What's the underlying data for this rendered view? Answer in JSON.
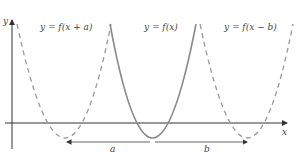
{
  "labels": {
    "y_axis": "y",
    "x_axis": "x",
    "left_curve": "y = f(x + a)",
    "center_curve": "y = f(x)",
    "right_curve": "y = f(x − b)",
    "shift_a": "a",
    "shift_b": "b"
  },
  "colors": {
    "axis": "#333333",
    "center_curve": "#8a8a8a",
    "dashed_curves": "#9a9a9a",
    "arrows": "#555555"
  }
}
